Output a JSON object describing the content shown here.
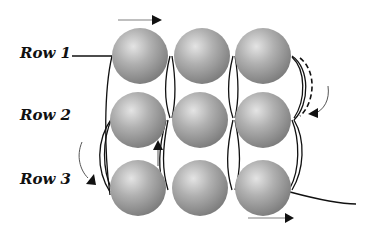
{
  "diagram": {
    "type": "bead-weaving-square-stitch",
    "rows": [
      {
        "label": "Row 1",
        "beads": 3
      },
      {
        "label": "Row 2",
        "beads": 3
      },
      {
        "label": "Row 3",
        "beads": 3
      }
    ],
    "colors": {
      "bead": "#9a9a9a",
      "thread": "#111111",
      "arrow": "#111111",
      "arrow_line": "#999999"
    }
  }
}
